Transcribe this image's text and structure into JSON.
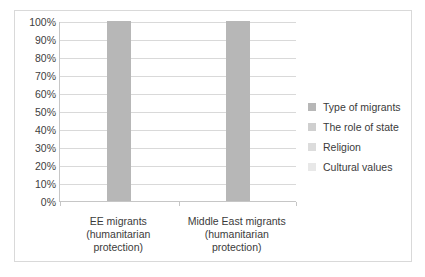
{
  "chart_data": {
    "type": "bar",
    "title": "",
    "subtitle": "",
    "xlabel": "",
    "ylabel": "",
    "categories": [
      "EE migrants (humanitarian protection)",
      "Middle East migrants (humanitarian protection)"
    ],
    "category_lines": [
      [
        "EE migrants",
        "(humanitarian",
        "protection)"
      ],
      [
        "Middle East migrants",
        "(humanitarian",
        "protection)"
      ]
    ],
    "series": [
      {
        "name": "Type of migrants",
        "values": [
          100,
          100
        ],
        "color": "#b7b7b7"
      },
      {
        "name": "The role of state",
        "values": [
          0,
          0
        ],
        "color": "#cfcfcf"
      },
      {
        "name": "Religion",
        "values": [
          0,
          0
        ],
        "color": "#dcdcdc"
      },
      {
        "name": "Cultural values",
        "values": [
          0,
          0
        ],
        "color": "#e8e8e8"
      }
    ],
    "ylim": [
      0,
      100
    ],
    "y_ticks": [
      0,
      10,
      20,
      30,
      40,
      50,
      60,
      70,
      80,
      90,
      100
    ],
    "y_tick_labels": [
      "0%",
      "10%",
      "20%",
      "30%",
      "40%",
      "50%",
      "60%",
      "70%",
      "80%",
      "90%",
      "100%"
    ],
    "grid": true,
    "legend_position": "right",
    "legend": [
      "Type of migrants",
      "The role of state",
      "Religion",
      "Cultural values"
    ],
    "annotations": [],
    "plot_border_color": "#d9d9d9",
    "gridline_color": "#d9d9d9",
    "axis_color": "#c6c6c6",
    "text_color": "#3b3b3b",
    "background": "#ffffff"
  }
}
